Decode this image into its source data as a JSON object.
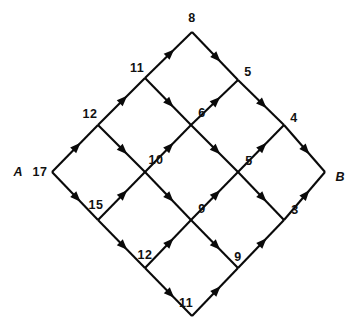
{
  "diagram": {
    "type": "directed-network-grid",
    "title": "",
    "terminals": [
      {
        "id": "A",
        "label": "A",
        "role": "source",
        "x": 18,
        "y": 172
      },
      {
        "id": "B",
        "label": "B",
        "role": "sink",
        "x": 340,
        "y": 177
      }
    ],
    "nodes": [
      {
        "id": "n_top",
        "x": 192,
        "y": 32
      },
      {
        "id": "n_11",
        "x": 145,
        "y": 78
      },
      {
        "id": "n_5a",
        "x": 238,
        "y": 80
      },
      {
        "id": "n_12",
        "x": 98,
        "y": 125
      },
      {
        "id": "n_6",
        "x": 191,
        "y": 125
      },
      {
        "id": "n_4",
        "x": 284,
        "y": 125
      },
      {
        "id": "n_A",
        "x": 52,
        "y": 172
      },
      {
        "id": "n_10",
        "x": 145,
        "y": 172
      },
      {
        "id": "n_5b",
        "x": 238,
        "y": 172
      },
      {
        "id": "n_B",
        "x": 325,
        "y": 172
      },
      {
        "id": "n_15",
        "x": 98,
        "y": 220
      },
      {
        "id": "n_9a",
        "x": 191,
        "y": 220
      },
      {
        "id": "n_3",
        "x": 284,
        "y": 220
      },
      {
        "id": "n_12b",
        "x": 145,
        "y": 268
      },
      {
        "id": "n_9b",
        "x": 238,
        "y": 268
      },
      {
        "id": "n_bottom",
        "x": 192,
        "y": 316
      }
    ],
    "edge_labels": [
      {
        "value": "8",
        "x": 192,
        "y": 18
      },
      {
        "value": "11",
        "x": 137,
        "y": 68
      },
      {
        "value": "5",
        "x": 248,
        "y": 72
      },
      {
        "value": "12",
        "x": 90,
        "y": 114
      },
      {
        "value": "6",
        "x": 202,
        "y": 113
      },
      {
        "value": "4",
        "x": 294,
        "y": 118
      },
      {
        "value": "17",
        "x": 40,
        "y": 172
      },
      {
        "value": "10",
        "x": 156,
        "y": 160
      },
      {
        "value": "5",
        "x": 249,
        "y": 161
      },
      {
        "value": "15",
        "x": 96,
        "y": 205
      },
      {
        "value": "9",
        "x": 202,
        "y": 209
      },
      {
        "value": "3",
        "x": 295,
        "y": 210
      },
      {
        "value": "12",
        "x": 145,
        "y": 255
      },
      {
        "value": "9",
        "x": 238,
        "y": 257
      },
      {
        "value": "11",
        "x": 186,
        "y": 303
      }
    ],
    "edges": [
      {
        "from": "n_A",
        "to": "n_12",
        "arrow_at": "to",
        "capacity": "12"
      },
      {
        "from": "n_A",
        "to": "n_15",
        "arrow_at": "to",
        "capacity": "15"
      },
      {
        "from": "n_12",
        "to": "n_11",
        "arrow_at": "to",
        "capacity": "11"
      },
      {
        "from": "n_12",
        "to": "n_10",
        "arrow_at": "to",
        "capacity": "10"
      },
      {
        "from": "n_11",
        "to": "n_top",
        "arrow_at": "to",
        "capacity": "8"
      },
      {
        "from": "n_11",
        "to": "n_6",
        "arrow_at": "to",
        "capacity": "6"
      },
      {
        "from": "n_top",
        "to": "n_5a",
        "arrow_at": "to",
        "capacity": "5"
      },
      {
        "from": "n_6",
        "to": "n_5a",
        "arrow_at": "to",
        "capacity": "5"
      },
      {
        "from": "n_5a",
        "to": "n_4",
        "arrow_at": "to",
        "capacity": "4"
      },
      {
        "from": "n_10",
        "to": "n_6",
        "arrow_at": "to",
        "capacity": "6"
      },
      {
        "from": "n_10",
        "to": "n_9a",
        "arrow_at": "to",
        "capacity": "9"
      },
      {
        "from": "n_15",
        "to": "n_10",
        "arrow_at": "to",
        "capacity": "10"
      },
      {
        "from": "n_15",
        "to": "n_12b",
        "arrow_at": "to",
        "capacity": "12"
      },
      {
        "from": "n_6",
        "to": "n_5b",
        "arrow_at": "to",
        "capacity": "5"
      },
      {
        "from": "n_9a",
        "to": "n_5b",
        "arrow_at": "to",
        "capacity": "5"
      },
      {
        "from": "n_5b",
        "to": "n_4",
        "arrow_at": "to",
        "capacity": "4"
      },
      {
        "from": "n_5b",
        "to": "n_3",
        "arrow_at": "to",
        "capacity": "3"
      },
      {
        "from": "n_4",
        "to": "n_B",
        "arrow_at": "to",
        "capacity": "4"
      },
      {
        "from": "n_3",
        "to": "n_B",
        "arrow_at": "to",
        "capacity": "3"
      },
      {
        "from": "n_9a",
        "to": "n_9b",
        "arrow_at": "to",
        "capacity": "9"
      },
      {
        "from": "n_12b",
        "to": "n_9a",
        "arrow_at": "to",
        "capacity": "9"
      },
      {
        "from": "n_12b",
        "to": "n_bottom",
        "arrow_at": "to",
        "capacity": "11"
      },
      {
        "from": "n_9b",
        "to": "n_3",
        "arrow_at": "to",
        "capacity": "3"
      },
      {
        "from": "n_bottom",
        "to": "n_9b",
        "arrow_at": "to",
        "capacity": "9"
      }
    ],
    "colors": {
      "stroke": "#0a0a0a",
      "background": "#ffffff",
      "text": "#111111"
    }
  }
}
